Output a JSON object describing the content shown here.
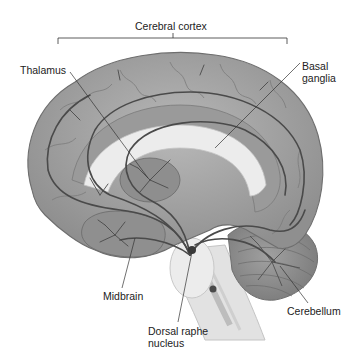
{
  "labels": {
    "cerebral_cortex": "Cerebral cortex",
    "thalamus": "Thalamus",
    "basal_ganglia_line1": "Basal",
    "basal_ganglia_line2": "ganglia",
    "midbrain": "Midbrain",
    "dorsal_raphe_line1": "Dorsal raphe",
    "dorsal_raphe_line2": "nucleus",
    "cerebellum": "Cerebellum"
  },
  "colors": {
    "cortex_fill": "#a8a8a8",
    "cortex_shadow": "#8a8a8a",
    "inner_light": "#e6e6e6",
    "pathway": "#555555",
    "label_text": "#222222",
    "leader_line": "#333333"
  }
}
